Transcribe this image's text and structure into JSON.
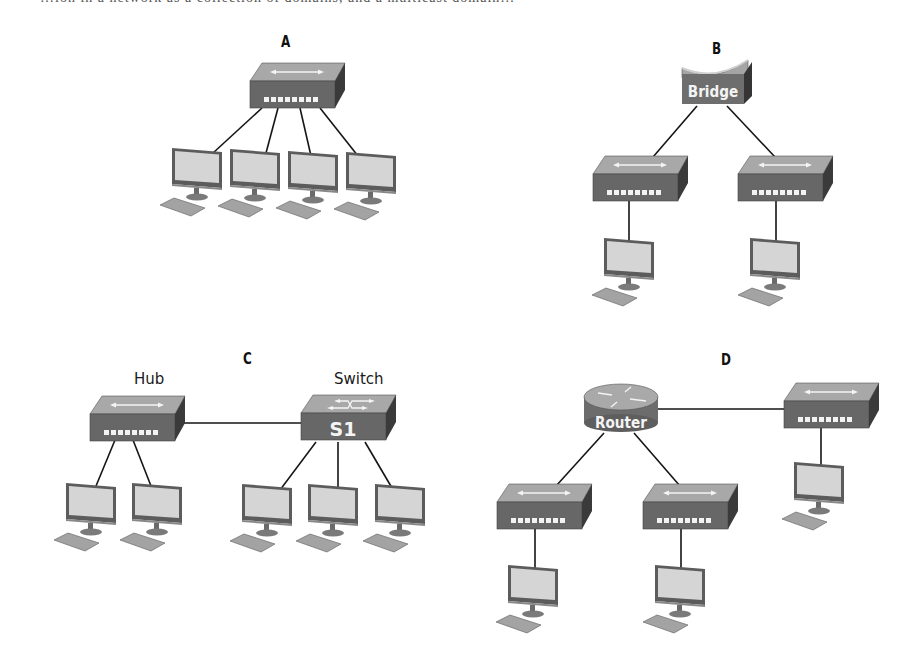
{
  "clipped_caption": "…ion in a network as a collection of domains, and a multicast domain…",
  "panels": [
    {
      "id": "A",
      "label": "A",
      "devices": [
        {
          "type": "hub",
          "name": "hub",
          "label": ""
        },
        {
          "type": "pc",
          "count": 4
        }
      ]
    },
    {
      "id": "B",
      "label": "B",
      "devices": [
        {
          "type": "bridge",
          "name": "bridge",
          "label": "Bridge"
        },
        {
          "type": "hub",
          "count": 2
        },
        {
          "type": "pc",
          "count": 2
        }
      ]
    },
    {
      "id": "C",
      "label": "C",
      "devices": [
        {
          "type": "hub",
          "name": "hub",
          "label": "Hub"
        },
        {
          "type": "switch",
          "name": "switch",
          "label": "Switch",
          "badge": "S1"
        },
        {
          "type": "pc",
          "count": 5
        }
      ]
    },
    {
      "id": "D",
      "label": "D",
      "devices": [
        {
          "type": "router",
          "name": "router",
          "label": "Router"
        },
        {
          "type": "hub",
          "count": 3
        },
        {
          "type": "pc",
          "count": 3
        }
      ]
    }
  ],
  "labels": {
    "a": "A",
    "b": "B",
    "c": "C",
    "d": "D",
    "bridge": "Bridge",
    "hub": "Hub",
    "switch": "Switch",
    "s1": "S1",
    "router": "Router"
  },
  "colors": {
    "device_top": "#a9a9a9",
    "device_front": "#6a6a6a",
    "device_side": "#3d3d3d",
    "port": "#f2f2f2",
    "screen": "#d6d6d6",
    "bezel": "#5a5a5a",
    "keyboard": "#9e9e9e",
    "link": "#151515"
  }
}
